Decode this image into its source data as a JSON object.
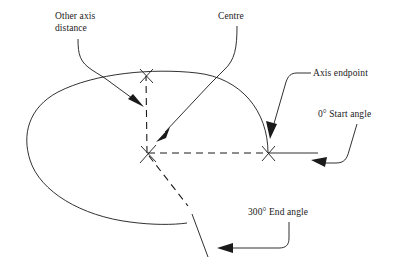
{
  "diagram": {
    "colors": {
      "line": "#1a1a1a",
      "background": "#ffffff"
    },
    "labels": {
      "other_axis_distance_line1": "Other axis",
      "other_axis_distance_line2": "distance",
      "centre": "Centre",
      "axis_endpoint": "Axis endpoint",
      "start_angle": "0° Start angle",
      "end_angle": "300° End angle"
    },
    "markers": {
      "centre_point": "x-marker-centre",
      "axis_endpoint_point": "x-marker-axis-endpoint",
      "other_axis_point": "x-marker-other-axis"
    },
    "values": {
      "start_angle_degrees": "0°",
      "end_angle_degrees": "300°"
    }
  }
}
